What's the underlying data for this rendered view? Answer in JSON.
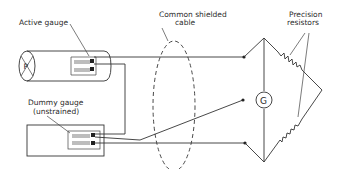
{
  "diagram": {
    "title": "",
    "labels": {
      "active_gauge": "Active gauge",
      "common_cable_line1": "Common shielded",
      "common_cable_line2": "cable",
      "precision_line1": "Precision",
      "precision_line2": "resistors",
      "dummy_line1": "Dummy gauge",
      "dummy_line2": "(unstrained)",
      "pressure_symbol": "P",
      "galvanometer_symbol": "G"
    },
    "components": [
      {
        "id": "active-gauge",
        "type": "strain-gauge",
        "mounted_on": "cylinder"
      },
      {
        "id": "dummy-gauge",
        "type": "strain-gauge",
        "mounted_on": "unstrained block"
      },
      {
        "id": "shielded-cable",
        "type": "cable-shield"
      },
      {
        "id": "galvanometer",
        "type": "meter"
      },
      {
        "id": "precision-resistor-1",
        "type": "resistor"
      },
      {
        "id": "precision-resistor-2",
        "type": "resistor"
      }
    ],
    "colors": {
      "line": "#333333",
      "background": "#ffffff"
    }
  }
}
